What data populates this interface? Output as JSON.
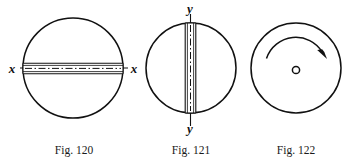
{
  "plate": {
    "background_color": "#ffffff",
    "ink_color": "#111111",
    "width": 350,
    "height": 166
  },
  "figures": [
    {
      "id": "fig-120",
      "caption": "Fig. 120",
      "caption_x": 74,
      "caption_y": 154,
      "description": "Circle shown edge-on with a horizontal slot band across the diameter; axis of rotation labelled x at both ends.",
      "circle": {
        "cx": 73,
        "cy": 68,
        "r": 50
      },
      "axis": {
        "orientation": "horizontal",
        "label_start": "x",
        "label_end": "x",
        "label_start_x": 12,
        "label_start_y": 73,
        "label_end_x": 134,
        "label_end_y": 73,
        "line_x1": 20,
        "line_x2": 128,
        "line_y": 68
      },
      "band": {
        "x1": 23,
        "x2": 123,
        "y_top": 63,
        "y_bottom": 74,
        "centerline_y": 68,
        "inner_offset": 2
      }
    },
    {
      "id": "fig-121",
      "caption": "Fig. 121",
      "caption_x": 191,
      "caption_y": 154,
      "description": "Same disc rotated 90 degrees: circle with a vertical slot band; axis of rotation labelled y at top and bottom.",
      "circle": {
        "cx": 191,
        "cy": 68,
        "r": 45
      },
      "axis": {
        "orientation": "vertical",
        "label_start": "y",
        "label_end": "y",
        "label_start_x": 190,
        "label_start_y": 12,
        "label_end_x": 190,
        "label_end_y": 133,
        "line_y1": 14,
        "line_y2": 126,
        "line_x": 190
      },
      "band": {
        "y1": 23,
        "y2": 113,
        "x_left": 185,
        "x_right": 196,
        "centerline_x": 190,
        "inner_offset": 2
      }
    },
    {
      "id": "fig-122",
      "caption": "Fig. 122",
      "caption_x": 296,
      "caption_y": 154,
      "description": "Disc seen face-on: large circle with a small circle marking the centre hole and a curved arrow indicating clockwise rotation.",
      "circle": {
        "cx": 296,
        "cy": 68,
        "r": 45
      },
      "hub": {
        "cx": 296,
        "cy": 70,
        "r": 4
      },
      "rotation_arrow": {
        "direction": "clockwise",
        "arc_radius": 31,
        "start_angle_deg": 198,
        "end_angle_deg": 338,
        "arrowhead_at": "end"
      }
    }
  ]
}
